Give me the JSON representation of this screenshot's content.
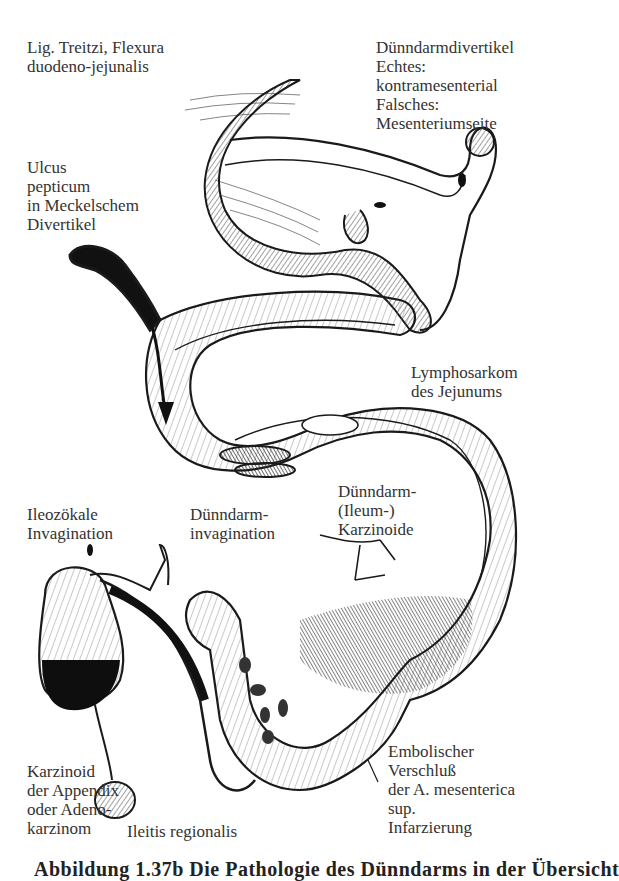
{
  "figure": {
    "labels": {
      "treitz": [
        "Lig. Treitzi, Flexura",
        "duodeno-jejunalis"
      ],
      "divertikel": [
        "Dünndarmdivertikel",
        "Echtes:",
        "kontramesenterial",
        "Falsches:",
        "Mesenteriumseite"
      ],
      "ulcus": [
        "Ulcus",
        "pepticum",
        "in Meckelschem",
        "Divertikel"
      ],
      "lymphosarkom": [
        "Lymphosarkom",
        "des Jejunums"
      ],
      "ileozoekal": [
        "Ileozökale",
        "Invagination"
      ],
      "duenndarm_invagination": [
        "Dünndarm-",
        "invagination"
      ],
      "karzinoide": [
        "Dünndarm-",
        "(Ileum-)",
        "Karzinoide"
      ],
      "appendix": [
        "Karzinoid",
        "der Appendix",
        "oder Adeno-",
        "karzinom"
      ],
      "ileitis": [
        "Ileitis regionalis"
      ],
      "embolie": [
        "Embolischer",
        "Verschluß",
        "der A. mesenterica",
        "sup.",
        "Infarzierung"
      ]
    },
    "caption": "Abbildung 1.37b Die Pathologie des Dünndarms in der Übersicht"
  },
  "colors": {
    "ink": "#1a1a1a",
    "text": "#333333",
    "background": "#ffffff"
  }
}
